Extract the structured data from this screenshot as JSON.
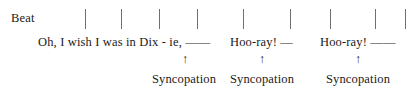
{
  "figure": {
    "type": "rhythm-syncopation-diagram",
    "background_color": "#ffffff",
    "text_color": "#1a1a1a",
    "tick_color": "#6f6f6f"
  },
  "beat_row": {
    "label": "Beat",
    "tick_count": 9,
    "ticks": [
      {
        "x": 85
      },
      {
        "x": 121
      },
      {
        "x": 159
      },
      {
        "x": 197
      },
      {
        "x": 243
      },
      {
        "x": 290
      },
      {
        "x": 330
      },
      {
        "x": 375
      },
      {
        "x": 405
      }
    ]
  },
  "lyrics": [
    {
      "text": "Oh, I wish I was in Dix - ie, ——",
      "x": 38
    },
    {
      "text": "Hoo-ray! —",
      "x": 230
    },
    {
      "text": "Hoo-ray! ——",
      "x": 320
    }
  ],
  "annotations": {
    "arrow_glyph": "↑",
    "items": [
      {
        "label": "Syncopation",
        "arrow_x": 185,
        "label_x": 184
      },
      {
        "label": "Syncopation",
        "arrow_x": 262,
        "label_x": 262
      },
      {
        "label": "Syncopation",
        "arrow_x": 358,
        "label_x": 358
      }
    ]
  }
}
